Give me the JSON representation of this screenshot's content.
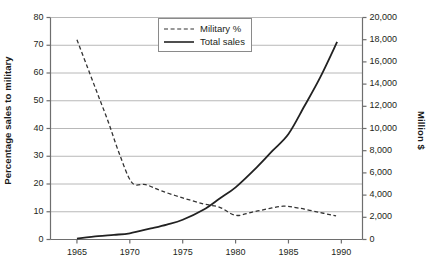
{
  "chart_data": {
    "type": "line",
    "title": "",
    "subtitle": "",
    "xlabel": "",
    "ylabel": "Percentage sales to military",
    "y2label": "Million $",
    "x": [
      1965,
      1970,
      1975,
      1980,
      1985,
      1990
    ],
    "xlim": [
      1962.5,
      1992.0
    ],
    "ylim": [
      0,
      80
    ],
    "y2lim": [
      0,
      20000
    ],
    "xticks": [
      "1965",
      "1970",
      "1975",
      "1980",
      "1985",
      "1990"
    ],
    "yticks": [
      "0",
      "10",
      "20",
      "30",
      "40",
      "50",
      "60",
      "70",
      "80"
    ],
    "y2ticks": [
      "0",
      "2,000",
      "4,000",
      "6,000",
      "8,000",
      "10,000",
      "12,000",
      "14,000",
      "16,000",
      "18,000",
      "20,000"
    ],
    "grid": true,
    "grid_axis": "y-left",
    "legend_position": "top-center",
    "series": [
      {
        "name": "Military %",
        "axis": "left",
        "style": "dashed",
        "color": "#333333",
        "units": "percent",
        "points": [
          {
            "x": 1965.0,
            "y": 72.0
          },
          {
            "x": 1966.0,
            "y": 62.0
          },
          {
            "x": 1967.0,
            "y": 52.0
          },
          {
            "x": 1968.0,
            "y": 42.0
          },
          {
            "x": 1969.0,
            "y": 31.0
          },
          {
            "x": 1970.2,
            "y": 20.5
          },
          {
            "x": 1971.5,
            "y": 19.8
          },
          {
            "x": 1973.0,
            "y": 17.5
          },
          {
            "x": 1975.0,
            "y": 15.0
          },
          {
            "x": 1977.0,
            "y": 12.8
          },
          {
            "x": 1978.5,
            "y": 11.6
          },
          {
            "x": 1980.0,
            "y": 8.7
          },
          {
            "x": 1981.5,
            "y": 9.8
          },
          {
            "x": 1983.0,
            "y": 11.0
          },
          {
            "x": 1984.5,
            "y": 12.0
          },
          {
            "x": 1986.0,
            "y": 11.3
          },
          {
            "x": 1988.0,
            "y": 9.7
          },
          {
            "x": 1989.5,
            "y": 8.5
          }
        ]
      },
      {
        "name": "Total sales",
        "axis": "right",
        "style": "solid",
        "color": "#222222",
        "units": "million-dollars",
        "points": [
          {
            "x": 1965.0,
            "y": 80
          },
          {
            "x": 1967.0,
            "y": 300
          },
          {
            "x": 1968.5,
            "y": 420
          },
          {
            "x": 1970.0,
            "y": 560
          },
          {
            "x": 1972.0,
            "y": 1000
          },
          {
            "x": 1973.5,
            "y": 1350
          },
          {
            "x": 1975.0,
            "y": 1780
          },
          {
            "x": 1977.0,
            "y": 2700
          },
          {
            "x": 1978.5,
            "y": 3700
          },
          {
            "x": 1980.0,
            "y": 4700
          },
          {
            "x": 1982.0,
            "y": 6500
          },
          {
            "x": 1983.5,
            "y": 8000
          },
          {
            "x": 1985.0,
            "y": 9500
          },
          {
            "x": 1986.5,
            "y": 12000
          },
          {
            "x": 1988.0,
            "y": 14600
          },
          {
            "x": 1989.6,
            "y": 17800
          }
        ]
      }
    ]
  },
  "legend": {
    "items": [
      {
        "label": "Military %",
        "style": "dashed"
      },
      {
        "label": "Total sales",
        "style": "solid"
      }
    ]
  },
  "axes": {
    "left_title": "Percentage sales to military",
    "right_title": "Million $"
  },
  "colors": {
    "grid": "#b8b8b8",
    "axis": "#6e6e6e",
    "series_military": "#333333",
    "series_total": "#222222",
    "text": "#231f20"
  }
}
